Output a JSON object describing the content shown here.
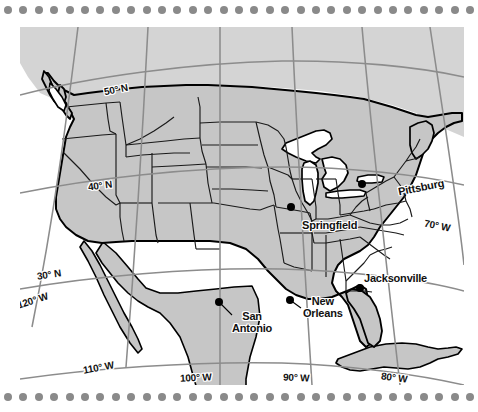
{
  "map": {
    "title": "United States reference map with latitude and longitude grid",
    "region": "Contiguous United States, southern Canada, northern Mexico and Cuba",
    "projection": "conic",
    "colors": {
      "land_fill": "#c6c6c6",
      "land_fill_light": "#d6d6d6",
      "ocean_fill": "#ffffff",
      "lake_fill": "#ffffff",
      "coastline": "#000000",
      "state_border": "#1a1a1a",
      "graticule": "#8c8c8c",
      "label_text": "#111111",
      "city_dot": "#000000",
      "border_dots": "#8a8a8a",
      "page_background": "#ffffff"
    },
    "border_decoration": {
      "name": "dotted-border",
      "dot_count_per_row": 31,
      "dot_diameter_px": 8,
      "dot_spacing_px": 15.4
    },
    "graticule": {
      "parallels": [
        {
          "label": "50° N",
          "value_deg": 50,
          "x": 104,
          "y": 87,
          "rotate_deg": -11
        },
        {
          "label": "40° N",
          "value_deg": 40,
          "x": 88,
          "y": 183,
          "rotate_deg": -7
        },
        {
          "label": "30° N",
          "value_deg": 30,
          "x": 37,
          "y": 272,
          "rotate_deg": -7
        }
      ],
      "meridians": [
        {
          "label": "120° W",
          "value_deg": -120,
          "x": 16,
          "y": 296,
          "rotate_deg": -18
        },
        {
          "label": "110° W",
          "value_deg": -110,
          "x": 83,
          "y": 363,
          "rotate_deg": -10
        },
        {
          "label": "100° W",
          "value_deg": -100,
          "x": 180,
          "y": 373,
          "rotate_deg": -3
        },
        {
          "label": "90° W",
          "value_deg": -90,
          "x": 283,
          "y": 373,
          "rotate_deg": 2
        },
        {
          "label": "80° W",
          "value_deg": -80,
          "x": 381,
          "y": 373,
          "rotate_deg": 7
        },
        {
          "label": "70° W",
          "value_deg": -70,
          "x": 424,
          "y": 221,
          "rotate_deg": 11
        }
      ]
    },
    "cities": [
      {
        "name": "Springfield",
        "label_lines": [
          "Springfield"
        ],
        "dot": {
          "x": 291,
          "y": 207
        },
        "label": {
          "x": 302,
          "y": 220
        },
        "leader": false
      },
      {
        "name": "Pittsburg",
        "label_lines": [
          "Pittsburg"
        ],
        "dot": {
          "x": 362,
          "y": 184
        },
        "label": {
          "x": 398,
          "y": 182
        },
        "label_rotate_deg": -10,
        "leader": false
      },
      {
        "name": "Jacksonville",
        "label_lines": [
          "Jacksonville"
        ],
        "dot": {
          "x": 360,
          "y": 288
        },
        "label": {
          "x": 364,
          "y": 273
        },
        "leader": false
      },
      {
        "name": "New Orleans",
        "label_lines": [
          "New",
          "Orleans"
        ],
        "dot": {
          "x": 290,
          "y": 300
        },
        "label": {
          "x": 303,
          "y": 296
        },
        "leader": true
      },
      {
        "name": "San Antonio",
        "label_lines": [
          "San",
          "Antonio"
        ],
        "dot": {
          "x": 219,
          "y": 302
        },
        "label": {
          "x": 232,
          "y": 311
        },
        "leader": true
      }
    ]
  }
}
